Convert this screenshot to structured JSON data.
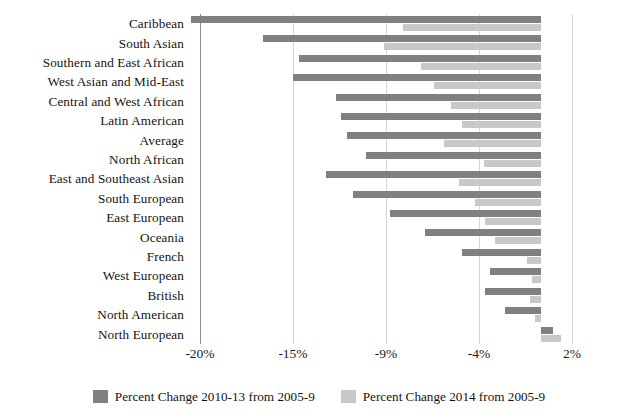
{
  "chart_data": {
    "type": "bar",
    "orientation": "horizontal",
    "title": "",
    "subtitle": "",
    "xlabel": "",
    "ylabel": "",
    "grid": true,
    "legend_position": "bottom",
    "xlim": [
      -22,
      2.6
    ],
    "zero_value": 0,
    "tick_labels": [
      "-20%",
      "-15%",
      "-9%",
      "-4%",
      "2%"
    ],
    "tick_values": [
      -20,
      -15,
      -9,
      -4,
      2
    ],
    "categories": [
      "Caribbean",
      "South Asian",
      "Southern and East African",
      "West Asian and Mid-East",
      "Central and West African",
      "Latin American",
      "Average",
      "North African",
      "East and Southeast Asian",
      "South European",
      "East European",
      "Oceania",
      "French",
      "West European",
      "British",
      "North American",
      "North European"
    ],
    "series": [
      {
        "name": "Percent Change 2010-13 from 2005-9",
        "color": "#808080",
        "values": [
          -20.5,
          -16.6,
          -14.6,
          -15.0,
          -12.2,
          -11.9,
          -11.5,
          -10.3,
          -12.9,
          -11.1,
          -8.8,
          -6.9,
          -4.9,
          -3.3,
          -3.6,
          -2.3,
          0.8
        ]
      },
      {
        "name": "Percent Change 2014 from 2005-9",
        "color": "#c8c8c8",
        "values": [
          -8.1,
          -9.1,
          -7.1,
          -6.4,
          -5.5,
          -4.9,
          -5.9,
          -3.7,
          -5.1,
          -4.2,
          -3.6,
          -3.0,
          -0.9,
          -0.6,
          -0.7,
          -0.4,
          1.3
        ]
      }
    ]
  },
  "legend": {
    "items": [
      {
        "label": "Percent Change 2010-13 from 2005-9",
        "color": "#808080"
      },
      {
        "label": "Percent Change 2014 from 2005-9",
        "color": "#c8c8c8"
      }
    ]
  },
  "colors": {
    "series_dark": "#808080",
    "series_light": "#c8c8c8",
    "gridline": "#d6d6d6",
    "axis_line": "#8c8c8c",
    "text": "#15130f",
    "background": "#ffffff"
  }
}
